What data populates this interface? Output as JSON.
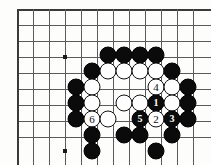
{
  "diagram": {
    "board": {
      "left": 17,
      "top": 9,
      "spacing": 16,
      "cols": 12,
      "rows": 9,
      "line_color": "#5a5a5a",
      "edge_color": "#3a3a3a",
      "background": "#fdfdfb"
    },
    "star_points": [
      {
        "name": "hoshi-upper-left",
        "x": 65,
        "y": 57
      },
      {
        "name": "hoshi-lower-left",
        "x": 65,
        "y": 151
      }
    ],
    "colors": {
      "black": "#0b0b0b",
      "white": "#ffffff",
      "number_on_black": "#ffffff",
      "number_on_white": "#0b0b0b"
    },
    "stones": [
      {
        "name": "stone-black-a",
        "color": "black",
        "x": 108,
        "y": 55,
        "label": ""
      },
      {
        "name": "stone-black-b",
        "color": "black",
        "x": 124,
        "y": 55,
        "label": ""
      },
      {
        "name": "stone-black-c",
        "color": "black",
        "x": 140,
        "y": 55,
        "label": ""
      },
      {
        "name": "stone-black-d",
        "color": "black",
        "x": 156,
        "y": 55,
        "label": ""
      },
      {
        "name": "stone-black-e",
        "color": "black",
        "x": 92,
        "y": 71,
        "label": ""
      },
      {
        "name": "stone-white-a",
        "color": "white",
        "x": 108,
        "y": 71,
        "label": ""
      },
      {
        "name": "stone-white-b",
        "color": "white",
        "x": 124,
        "y": 71,
        "label": ""
      },
      {
        "name": "stone-white-c",
        "color": "white",
        "x": 140,
        "y": 71,
        "label": ""
      },
      {
        "name": "stone-white-d",
        "color": "white",
        "x": 156,
        "y": 71,
        "label": ""
      },
      {
        "name": "stone-black-f",
        "color": "black",
        "x": 172,
        "y": 71,
        "label": ""
      },
      {
        "name": "stone-black-g",
        "color": "black",
        "x": 76,
        "y": 87,
        "label": ""
      },
      {
        "name": "stone-white-e",
        "color": "white",
        "x": 92,
        "y": 87,
        "label": ""
      },
      {
        "name": "stone-white-move-4",
        "color": "white",
        "x": 156,
        "y": 87,
        "label": "4"
      },
      {
        "name": "stone-white-f",
        "color": "white",
        "x": 172,
        "y": 87,
        "label": ""
      },
      {
        "name": "stone-black-h",
        "color": "black",
        "x": 188,
        "y": 87,
        "label": ""
      },
      {
        "name": "stone-black-i",
        "color": "black",
        "x": 76,
        "y": 103,
        "label": ""
      },
      {
        "name": "stone-white-g",
        "color": "white",
        "x": 92,
        "y": 103,
        "label": ""
      },
      {
        "name": "stone-white-h",
        "color": "white",
        "x": 124,
        "y": 103,
        "label": ""
      },
      {
        "name": "stone-white-i",
        "color": "white",
        "x": 140,
        "y": 103,
        "label": ""
      },
      {
        "name": "stone-black-move-1",
        "color": "black",
        "x": 156,
        "y": 103,
        "label": "1"
      },
      {
        "name": "stone-white-j",
        "color": "white",
        "x": 172,
        "y": 103,
        "label": ""
      },
      {
        "name": "stone-black-j",
        "color": "black",
        "x": 188,
        "y": 103,
        "label": ""
      },
      {
        "name": "stone-black-k",
        "color": "black",
        "x": 76,
        "y": 119,
        "label": ""
      },
      {
        "name": "stone-white-move-6",
        "color": "white",
        "x": 92,
        "y": 119,
        "label": "6"
      },
      {
        "name": "stone-white-k",
        "color": "white",
        "x": 108,
        "y": 119,
        "label": ""
      },
      {
        "name": "stone-black-move-5",
        "color": "black",
        "x": 140,
        "y": 119,
        "label": "5"
      },
      {
        "name": "stone-white-move-2",
        "color": "white",
        "x": 156,
        "y": 119,
        "label": "2"
      },
      {
        "name": "stone-black-move-3",
        "color": "black",
        "x": 172,
        "y": 119,
        "label": "3"
      },
      {
        "name": "stone-black-l",
        "color": "black",
        "x": 188,
        "y": 119,
        "label": ""
      },
      {
        "name": "stone-black-m",
        "color": "black",
        "x": 92,
        "y": 135,
        "label": ""
      },
      {
        "name": "stone-black-n",
        "color": "black",
        "x": 124,
        "y": 135,
        "label": ""
      },
      {
        "name": "stone-black-o",
        "color": "black",
        "x": 140,
        "y": 135,
        "label": ""
      },
      {
        "name": "stone-black-p",
        "color": "black",
        "x": 172,
        "y": 135,
        "label": ""
      },
      {
        "name": "stone-black-q",
        "color": "black",
        "x": 92,
        "y": 151,
        "label": ""
      },
      {
        "name": "stone-black-r",
        "color": "black",
        "x": 156,
        "y": 151,
        "label": ""
      }
    ]
  }
}
